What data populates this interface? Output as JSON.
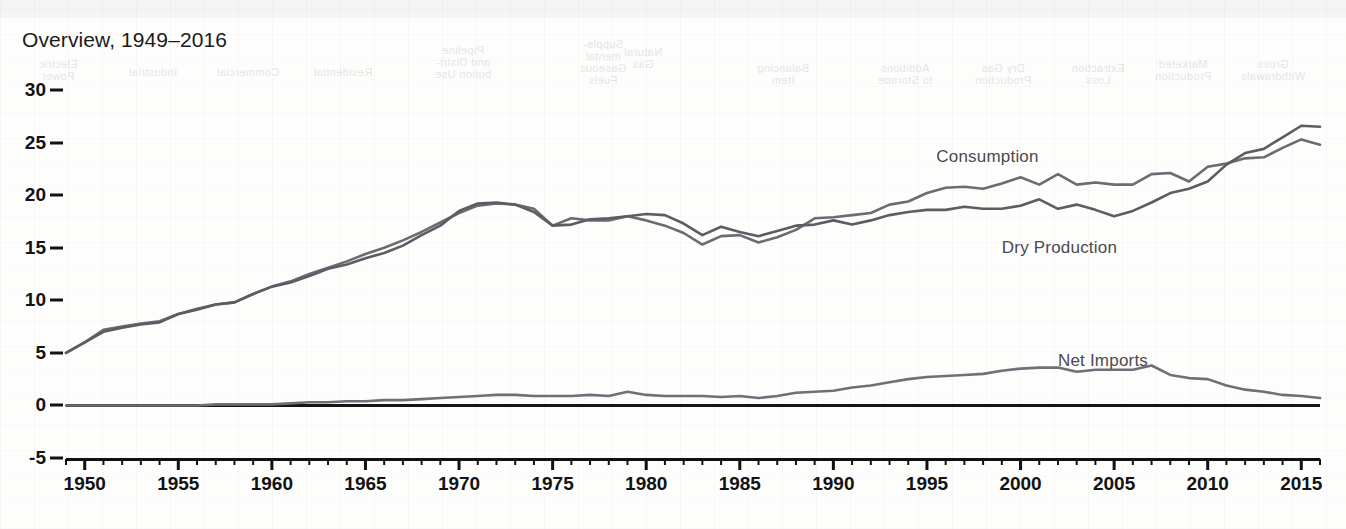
{
  "title": "Overview, 1949–2016",
  "axes": {
    "y_ticks": [
      30,
      25,
      20,
      15,
      10,
      5,
      0,
      -5
    ],
    "x_ticks": [
      1950,
      1955,
      1960,
      1965,
      1970,
      1975,
      1980,
      1985,
      1990,
      1995,
      2000,
      2005,
      2010,
      2015
    ],
    "ylim": [
      -5,
      30
    ],
    "xlim": [
      1949,
      2016
    ],
    "x_minor_tick_step": 1
  },
  "series_labels": [
    {
      "name": "Consumption",
      "x": 1995.5,
      "y": 24.6
    },
    {
      "name": "Dry Production",
      "x": 1999.0,
      "y": 15.9
    },
    {
      "name": "Net Imports",
      "x": 2002.0,
      "y": 5.2
    }
  ],
  "colors": {
    "consumption": "#6b6b72",
    "dry_production": "#5c5c63",
    "net_imports": "#6f6f76",
    "zero_line": "#151515",
    "axis": "#111111",
    "title_text": "#1b1b1b",
    "label_text": "#4a4a50",
    "background": "#fdfdfc"
  },
  "bleed_through_headers": [
    {
      "text": "Natural\nGas",
      "x": 660,
      "y": 24
    },
    {
      "text": "Supple-\nmental\nGaseous\nFuels",
      "x": 700,
      "y": 16
    },
    {
      "text": "Balancing\nItem",
      "x": 520,
      "y": 40
    },
    {
      "text": "Additions\nto Storage",
      "x": 398,
      "y": 40
    },
    {
      "text": "Dry Gas\nProduction",
      "x": 300,
      "y": 40
    },
    {
      "text": "Extraction\nLoss",
      "x": 205,
      "y": 40
    },
    {
      "text": "Marketed\nProduction",
      "x": 120,
      "y": 36
    },
    {
      "text": "Gross\nWithdrawals",
      "x": 30,
      "y": 36
    },
    {
      "text": "Pipeline\nand Distri-\nbution Use",
      "x": 840,
      "y": 22
    },
    {
      "text": "Residential",
      "x": 960,
      "y": 44
    },
    {
      "text": "Commercial",
      "x": 1055,
      "y": 44
    },
    {
      "text": "Industrial",
      "x": 1150,
      "y": 44
    },
    {
      "text": "Electric\nPower",
      "x": 1245,
      "y": 36
    }
  ],
  "chart_data": {
    "type": "line",
    "title": "Overview, 1949–2016",
    "xlabel": "",
    "ylabel": "",
    "xlim": [
      1949,
      2016
    ],
    "ylim": [
      -5,
      30
    ],
    "grid": false,
    "legend": "inline-annotations",
    "x": [
      1949,
      1950,
      1951,
      1952,
      1953,
      1954,
      1955,
      1956,
      1957,
      1958,
      1959,
      1960,
      1961,
      1962,
      1963,
      1964,
      1965,
      1966,
      1967,
      1968,
      1969,
      1970,
      1971,
      1972,
      1973,
      1974,
      1975,
      1976,
      1977,
      1978,
      1979,
      1980,
      1981,
      1982,
      1983,
      1984,
      1985,
      1986,
      1987,
      1988,
      1989,
      1990,
      1991,
      1992,
      1993,
      1994,
      1995,
      1996,
      1997,
      1998,
      1999,
      2000,
      2001,
      2002,
      2003,
      2004,
      2005,
      2006,
      2007,
      2008,
      2009,
      2010,
      2011,
      2012,
      2013,
      2014,
      2015,
      2016
    ],
    "series": [
      {
        "name": "Consumption",
        "values": [
          5.0,
          6.0,
          7.2,
          7.5,
          7.8,
          8.0,
          8.7,
          9.2,
          9.6,
          9.8,
          10.6,
          11.3,
          11.8,
          12.5,
          13.1,
          13.7,
          14.4,
          15.0,
          15.7,
          16.5,
          17.4,
          18.3,
          19.0,
          19.2,
          19.1,
          18.7,
          17.1,
          17.8,
          17.6,
          17.6,
          18.0,
          17.6,
          17.1,
          16.4,
          15.3,
          16.1,
          16.2,
          15.5,
          16.0,
          16.7,
          17.8,
          17.9,
          18.1,
          18.3,
          19.1,
          19.4,
          20.2,
          20.7,
          20.8,
          20.6,
          21.1,
          21.7,
          21.0,
          22.0,
          21.0,
          21.2,
          21.0,
          21.0,
          22.0,
          22.1,
          21.3,
          22.7,
          23.0,
          23.5,
          23.6,
          24.5,
          25.3,
          24.8
        ]
      },
      {
        "name": "Dry Production",
        "values": [
          5.0,
          6.0,
          7.0,
          7.4,
          7.7,
          7.9,
          8.7,
          9.1,
          9.6,
          9.8,
          10.6,
          11.3,
          11.7,
          12.3,
          13.0,
          13.4,
          14.0,
          14.5,
          15.2,
          16.2,
          17.1,
          18.5,
          19.2,
          19.3,
          19.1,
          18.4,
          17.1,
          17.2,
          17.7,
          17.8,
          18.0,
          18.2,
          18.1,
          17.3,
          16.2,
          17.0,
          16.5,
          16.1,
          16.6,
          17.1,
          17.2,
          17.6,
          17.2,
          17.6,
          18.1,
          18.4,
          18.6,
          18.6,
          18.9,
          18.7,
          18.7,
          19.0,
          19.6,
          18.7,
          19.1,
          18.6,
          18.0,
          18.5,
          19.3,
          20.2,
          20.6,
          21.3,
          22.9,
          24.0,
          24.4,
          25.5,
          26.6,
          26.5
        ]
      },
      {
        "name": "Net Imports",
        "values": [
          0.0,
          0.0,
          0.0,
          0.0,
          0.0,
          0.0,
          0.0,
          0.0,
          0.1,
          0.1,
          0.1,
          0.1,
          0.2,
          0.3,
          0.3,
          0.4,
          0.4,
          0.5,
          0.5,
          0.6,
          0.7,
          0.8,
          0.9,
          1.0,
          1.0,
          0.9,
          0.9,
          0.9,
          1.0,
          0.9,
          1.3,
          1.0,
          0.9,
          0.9,
          0.9,
          0.8,
          0.9,
          0.7,
          0.9,
          1.2,
          1.3,
          1.4,
          1.7,
          1.9,
          2.2,
          2.5,
          2.7,
          2.8,
          2.9,
          3.0,
          3.3,
          3.5,
          3.6,
          3.6,
          3.2,
          3.4,
          3.4,
          3.4,
          3.8,
          2.9,
          2.6,
          2.5,
          1.9,
          1.5,
          1.3,
          1.0,
          0.9,
          0.7
        ]
      }
    ]
  }
}
